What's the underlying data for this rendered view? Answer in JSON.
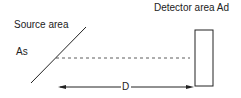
{
  "diagram": {
    "labels": {
      "source_area": "Source area",
      "source_symbol": "As",
      "detector_area": "Detector area  Ad",
      "distance": "D"
    },
    "colors": {
      "stroke": "#222222",
      "background": "#ffffff"
    }
  }
}
